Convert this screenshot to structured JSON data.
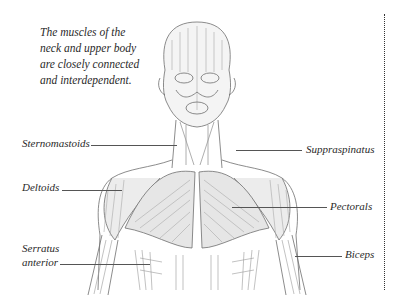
{
  "caption": {
    "lines": [
      "The muscles of the",
      "neck and upper body",
      "are closely connected",
      "and interdependent."
    ]
  },
  "labels": {
    "sternomastoids": "Sternomastoids",
    "suppraspinatus": "Suppraspinatus",
    "deltoids": "Deltoids",
    "pectorals": "Pectorals",
    "serratus_line1": "Serratus",
    "serratus_line2": "anterior",
    "biceps": "Biceps"
  },
  "colors": {
    "ink": "#2a2a2a",
    "sketch": "#6e6e6e",
    "shade": "#d8d8d8"
  }
}
